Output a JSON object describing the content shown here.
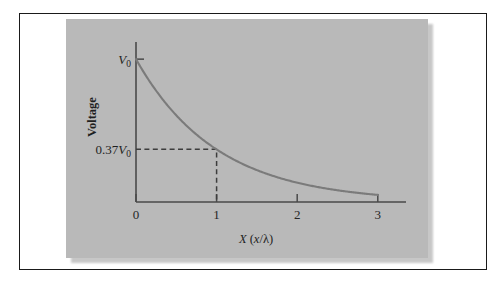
{
  "figure": {
    "panel_background": "#b9b9b9",
    "page_background": "#ffffff",
    "frame_color": "#1a1a1a",
    "curve_color": "#7b7b7b",
    "axis_color": "#4a4a4a"
  },
  "chart_data": {
    "type": "line",
    "title": "",
    "subtitle": "",
    "xlabel_parts": {
      "main": "X",
      "open": " (",
      "var": "x",
      "slash": "/",
      "lambda": "λ",
      "close": ")"
    },
    "xlabel": "X (x/λ)",
    "ylabel": "Voltage",
    "x_tick_labels": [
      "0",
      "1",
      "2",
      "3"
    ],
    "x_tick_values": [
      0,
      1,
      2,
      3
    ],
    "xlim": [
      0,
      3.35
    ],
    "ylim": [
      0,
      1.12
    ],
    "grid": false,
    "legend": null,
    "y_annotations": [
      {
        "label_value": "V",
        "label_sub": "0",
        "y": 1.0,
        "tick": true
      },
      {
        "label_prefix": "0.37",
        "label_value": "V",
        "label_sub": "0",
        "y": 0.37,
        "tick": false
      }
    ],
    "series": [
      {
        "name": "exponential decay",
        "equation": "V = V0 * exp(-x)",
        "x": [
          0,
          0.1,
          0.2,
          0.3,
          0.4,
          0.5,
          0.6,
          0.7,
          0.8,
          0.9,
          1.0,
          1.2,
          1.4,
          1.6,
          1.8,
          2.0,
          2.2,
          2.4,
          2.6,
          2.8,
          3.0
        ],
        "values": [
          1.0,
          0.905,
          0.819,
          0.741,
          0.67,
          0.607,
          0.549,
          0.497,
          0.449,
          0.407,
          0.37,
          0.301,
          0.247,
          0.202,
          0.165,
          0.135,
          0.111,
          0.091,
          0.074,
          0.061,
          0.05
        ]
      }
    ],
    "annotations": [
      {
        "type": "dashed-guide",
        "from_axis": "y",
        "y": 0.37,
        "x": 1.0,
        "description": "horizontal dashed line from y-axis to curve at x=1, then vertical dashed line down to x-axis"
      }
    ]
  }
}
